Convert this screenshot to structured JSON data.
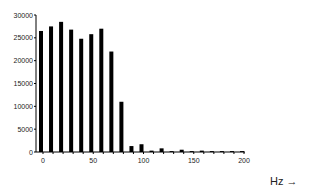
{
  "chart_data": {
    "type": "bar",
    "title": "",
    "xlabel": "Hz →",
    "ylabel": "",
    "x": [
      0,
      10,
      20,
      30,
      40,
      50,
      60,
      70,
      80,
      90,
      100,
      110,
      120,
      130,
      140,
      150,
      160,
      170,
      180,
      190,
      200
    ],
    "values": [
      26500,
      27500,
      28500,
      26800,
      24800,
      25800,
      27000,
      22000,
      11000,
      1300,
      1700,
      300,
      800,
      200,
      500,
      200,
      300,
      200,
      200,
      200,
      200
    ],
    "xlim": [
      0,
      200
    ],
    "ylim": [
      0,
      30000
    ],
    "xticks": [
      "0",
      "50",
      "100",
      "150",
      "200"
    ],
    "yticks": [
      "0",
      "5000",
      "10000",
      "15000",
      "20000",
      "25000",
      "30000"
    ],
    "grid": false,
    "legend": null,
    "bar_color": "#000000"
  },
  "axis_unit_label": "Hz →"
}
